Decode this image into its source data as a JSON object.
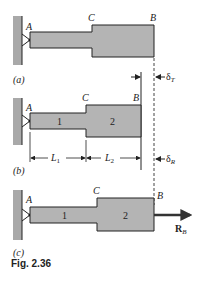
{
  "figure": {
    "caption": "Fig. 2.36",
    "colors": {
      "bar_fill": "#b4b4b4",
      "wall_fill": "#a9a9a9",
      "stroke": "#222222"
    },
    "panels": [
      {
        "id": "a",
        "label": "(a)",
        "point_A": "A",
        "point_C": "C",
        "point_B": "B",
        "delta": "δ",
        "delta_sub": "T"
      },
      {
        "id": "b",
        "label": "(b)",
        "point_A": "A",
        "point_C": "C",
        "point_B": "B",
        "seg1": "1",
        "seg2": "2",
        "dim1": "L",
        "dim1_sub": "1",
        "dim2": "L",
        "dim2_sub": "2",
        "delta": "δ",
        "delta_sub": "R"
      },
      {
        "id": "c",
        "label": "(c)",
        "point_A": "A",
        "point_C": "C",
        "point_B": "B",
        "seg1": "1",
        "seg2": "2",
        "force": "R",
        "force_sub": "B"
      }
    ]
  }
}
